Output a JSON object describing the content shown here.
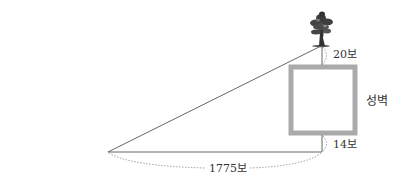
{
  "diagram": {
    "labels": {
      "top_distance": "20보",
      "bottom_distance": "14보",
      "horizontal_distance": "1775보",
      "wall": "성벽"
    },
    "icons": {
      "tree": "tree-icon"
    },
    "colors": {
      "line": "#555555",
      "wall_border": "#aaaaaa",
      "dashed": "#888888",
      "text": "#333333"
    }
  }
}
